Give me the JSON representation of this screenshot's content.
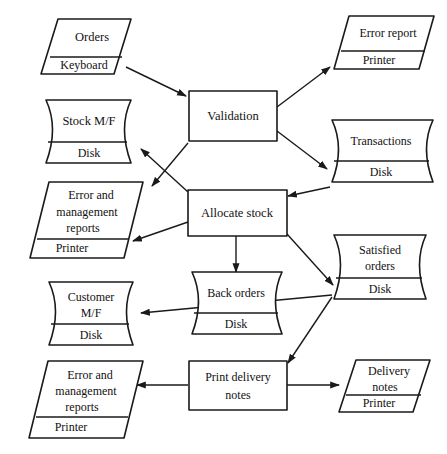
{
  "diagram": {
    "type": "system-flowchart",
    "background_color": "#ffffff",
    "line_color": "#1a1a1a",
    "nodes": [
      {
        "id": "orders",
        "shape": "parallelogram",
        "kind": "input",
        "label": "Orders",
        "media": "Keyboard"
      },
      {
        "id": "stock-mf",
        "shape": "cylinder",
        "kind": "storage",
        "label": "Stock M/F",
        "media": "Disk"
      },
      {
        "id": "error-management-reports-top",
        "shape": "parallelogram",
        "kind": "output",
        "label_line1": "Error and",
        "label_line2": "management",
        "label_line3": "reports",
        "media": "Printer"
      },
      {
        "id": "customer-mf",
        "shape": "cylinder",
        "kind": "storage",
        "label_line1": "Customer",
        "label_line2": "M/F",
        "media": "Disk"
      },
      {
        "id": "error-management-reports-bottom",
        "shape": "parallelogram",
        "kind": "output",
        "label_line1": "Error and",
        "label_line2": "management",
        "label_line3": "reports",
        "media": "Printer"
      },
      {
        "id": "validation",
        "shape": "rectangle",
        "kind": "process",
        "label": "Validation"
      },
      {
        "id": "allocate-stock",
        "shape": "rectangle",
        "kind": "process",
        "label": "Allocate stock"
      },
      {
        "id": "back-orders",
        "shape": "cylinder",
        "kind": "storage",
        "label": "Back orders",
        "media": "Disk"
      },
      {
        "id": "print-delivery-notes",
        "shape": "rectangle",
        "kind": "process",
        "label_line1": "Print delivery",
        "label_line2": "notes"
      },
      {
        "id": "error-report",
        "shape": "parallelogram",
        "kind": "output",
        "label": "Error report",
        "media": "Printer"
      },
      {
        "id": "transactions",
        "shape": "cylinder",
        "kind": "storage",
        "label": "Transactions",
        "media": "Disk"
      },
      {
        "id": "satisfied-orders",
        "shape": "cylinder",
        "kind": "storage",
        "label_line1": "Satisfied",
        "label_line2": "orders",
        "media": "Disk"
      },
      {
        "id": "delivery-notes",
        "shape": "parallelogram",
        "kind": "output",
        "label_line1": "Delivery",
        "label_line2": "notes",
        "media": "Printer"
      }
    ],
    "connections": [
      {
        "from": "orders",
        "to": "validation",
        "arrow": "to"
      },
      {
        "from": "validation",
        "to": "error-report",
        "arrow": "to"
      },
      {
        "from": "validation",
        "to": "transactions",
        "arrow": "to"
      },
      {
        "from": "validation",
        "to": "allocate-stock",
        "arrow": "to"
      },
      {
        "from": "transactions",
        "to": "allocate-stock",
        "arrow": "to"
      },
      {
        "from": "allocate-stock",
        "to": "stock-mf",
        "arrow": "to"
      },
      {
        "from": "allocate-stock",
        "to": "error-management-reports-top",
        "arrow": "to"
      },
      {
        "from": "allocate-stock",
        "to": "back-orders",
        "arrow": "to"
      },
      {
        "from": "allocate-stock",
        "to": "satisfied-orders",
        "arrow": "to"
      },
      {
        "from": "satisfied-orders",
        "to": "customer-mf",
        "arrow": "to"
      },
      {
        "from": "satisfied-orders",
        "to": "print-delivery-notes",
        "arrow": "to"
      },
      {
        "from": "print-delivery-notes",
        "to": "error-management-reports-bottom",
        "arrow": "to"
      },
      {
        "from": "print-delivery-notes",
        "to": "delivery-notes",
        "arrow": "to"
      }
    ]
  }
}
